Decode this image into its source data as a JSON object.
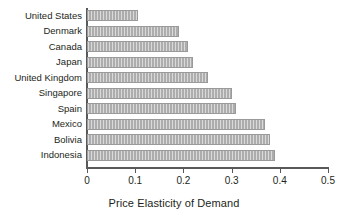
{
  "chart_data": {
    "type": "bar",
    "orientation": "horizontal",
    "title": "",
    "xlabel": "Price Elasticity of Demand",
    "ylabel": "",
    "categories": [
      "United States",
      "Denmark",
      "Canada",
      "Japan",
      "United Kingdom",
      "Singapore",
      "Spain",
      "Mexico",
      "Bolivia",
      "Indonesia"
    ],
    "values": [
      0.105,
      0.19,
      0.21,
      0.22,
      0.25,
      0.3,
      0.31,
      0.37,
      0.38,
      0.39
    ],
    "xlim": [
      0,
      0.5
    ],
    "xticks": [
      0,
      0.1,
      0.2,
      0.3,
      0.4,
      0.5
    ],
    "xtick_labels": [
      "0",
      "0.1",
      "0.2",
      "0.3",
      "0.4",
      "0.5"
    ],
    "grid": false,
    "legend": null,
    "bar_color": "#adadad",
    "axis_color": "#58595b",
    "text_color": "#231f20",
    "background": "#ffffff"
  }
}
